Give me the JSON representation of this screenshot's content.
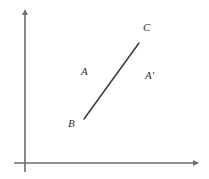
{
  "figure": {
    "background_color": "#ffffff",
    "axes": {
      "color": "#6d6d6d",
      "line_width": 1.6,
      "origin": {
        "x": 25,
        "y": 163
      },
      "y_axis": {
        "name": "vertical-axis",
        "x": 25,
        "y_top": 9,
        "y_bottom": 172,
        "arrowhead": "up",
        "tick_labels": [],
        "axis_label": ""
      },
      "x_axis": {
        "name": "horizontal-axis",
        "y": 163,
        "x_left": 14,
        "x_right": 199,
        "arrowhead": "right",
        "tick_labels": [],
        "axis_label": ""
      }
    },
    "segment": {
      "name": "segment-bc",
      "color": "#3a3a3a",
      "line_width": 1.5,
      "start": {
        "label": "B",
        "x": 84,
        "y": 119
      },
      "end": {
        "label": "C",
        "x": 139,
        "y": 43
      }
    },
    "labels": [
      {
        "id": "label-c",
        "text": "C",
        "x": 148,
        "y": 28,
        "style": "italic-serif"
      },
      {
        "id": "label-a",
        "text": "A",
        "x": 86,
        "y": 72,
        "style": "italic-serif"
      },
      {
        "id": "label-ap",
        "text": "A′",
        "x": 151,
        "y": 76,
        "style": "italic-serif"
      },
      {
        "id": "label-b",
        "text": "B",
        "x": 74,
        "y": 124,
        "style": "italic-serif"
      }
    ]
  }
}
